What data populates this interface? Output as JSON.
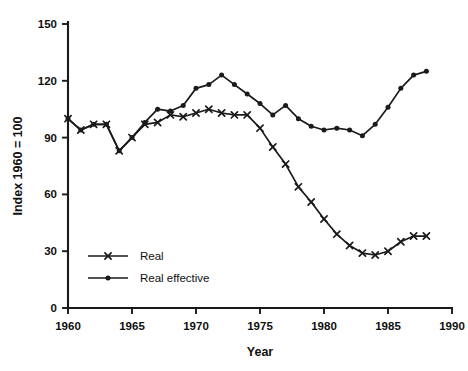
{
  "chart_data": {
    "type": "line",
    "title": "",
    "xlabel": "Year",
    "ylabel": "Index 1960 = 100",
    "xlim": [
      1960,
      1990
    ],
    "ylim": [
      0,
      150
    ],
    "xticks": [
      1960,
      1965,
      1970,
      1975,
      1980,
      1985,
      1990
    ],
    "yticks": [
      0,
      30,
      60,
      90,
      120,
      150
    ],
    "grid": false,
    "legend_position": "lower-left",
    "x": [
      1960,
      1961,
      1962,
      1963,
      1964,
      1965,
      1966,
      1967,
      1968,
      1969,
      1970,
      1971,
      1972,
      1973,
      1974,
      1975,
      1976,
      1977,
      1978,
      1979,
      1980,
      1981,
      1982,
      1983,
      1984,
      1985,
      1986,
      1987,
      1988
    ],
    "series": [
      {
        "name": "Real",
        "marker": "x",
        "values": [
          100,
          94,
          97,
          97,
          83,
          90,
          97,
          98,
          102,
          101,
          103,
          105,
          103,
          102,
          102,
          95,
          85,
          76,
          64,
          56,
          47,
          39,
          33,
          29,
          28,
          30,
          35,
          38,
          38
        ]
      },
      {
        "name": "Real effective",
        "marker": "circle",
        "values": [
          100,
          94,
          97,
          97,
          83,
          90,
          98,
          105,
          104,
          107,
          116,
          118,
          123,
          118,
          113,
          108,
          102,
          107,
          100,
          96,
          94,
          95,
          94,
          91,
          97,
          106,
          116,
          123,
          125
        ]
      }
    ],
    "legend_entries": [
      {
        "label": "Real",
        "marker": "x"
      },
      {
        "label": "Real effective",
        "marker": "circle"
      }
    ],
    "colors": {
      "line": "#1a1a1a",
      "axis": "#1a1a1a",
      "background": "#ffffff"
    }
  }
}
